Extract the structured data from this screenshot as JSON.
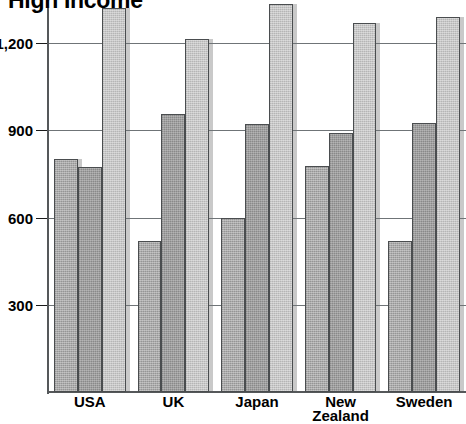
{
  "chart_data": {
    "type": "bar",
    "title": "High Income",
    "xlabel": "",
    "ylabel": "",
    "ylim": [
      0,
      1380
    ],
    "yticks": [
      300,
      600,
      900,
      1200
    ],
    "ytick_labels": [
      "300",
      "600",
      "900",
      "1,200"
    ],
    "grid": true,
    "legend": "none",
    "categories": [
      "USA",
      "UK",
      "Japan",
      "New Zealand",
      "Sweden"
    ],
    "category_lines": [
      [
        "USA"
      ],
      [
        "UK"
      ],
      [
        "Japan"
      ],
      [
        "New",
        "Zealand"
      ],
      [
        "Sweden"
      ]
    ],
    "series": [
      {
        "name": "series-1",
        "color": "#a0a0a0",
        "values": [
          800,
          520,
          598,
          778,
          520
        ]
      },
      {
        "name": "series-2",
        "color": "#999999",
        "values": [
          775,
          955,
          920,
          890,
          925
        ]
      },
      {
        "name": "series-3",
        "color": "#bfbfbf",
        "values": [
          1320,
          1215,
          1335,
          1270,
          1290
        ]
      }
    ]
  },
  "axis": {
    "axis_color": "#55585a",
    "gridline_color": "#6f7477"
  }
}
